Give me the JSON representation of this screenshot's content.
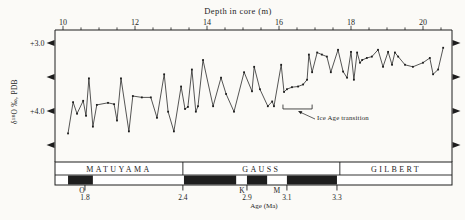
{
  "figure": {
    "background": "#fbfaf7",
    "ink": "#1e1e1e"
  },
  "chart_data": {
    "type": "line",
    "title": "Depth in core (m)",
    "ylabel": "δ¹⁸O ‰, PDB",
    "x_axis": {
      "label_position": "top",
      "ticks": [
        10,
        12,
        14,
        16,
        18,
        20
      ],
      "minor_step": 0.5,
      "minor_from": 10,
      "minor_to": 20.5,
      "range": [
        9.78,
        20.81
      ]
    },
    "y_axis": {
      "ticks": [
        {
          "value": 3.0,
          "label": "+3.0"
        },
        {
          "value": 3.5,
          "label": ""
        },
        {
          "value": 4.0,
          "label": "+4.0"
        },
        {
          "value": 4.5,
          "label": ""
        }
      ],
      "range_top": 2.8,
      "range_bottom": 4.75,
      "marker": "triangle-both-sides"
    },
    "series": [
      {
        "name": "delta-18O-record",
        "marker": "small-square",
        "points": [
          [
            10.14,
            4.33
          ],
          [
            10.28,
            3.87
          ],
          [
            10.39,
            4.04
          ],
          [
            10.56,
            3.85
          ],
          [
            10.64,
            4.07
          ],
          [
            10.72,
            3.52
          ],
          [
            10.83,
            4.23
          ],
          [
            10.94,
            3.91
          ],
          [
            11.25,
            3.88
          ],
          [
            11.42,
            3.9
          ],
          [
            11.5,
            4.14
          ],
          [
            11.61,
            3.52
          ],
          [
            11.83,
            4.3
          ],
          [
            11.94,
            3.78
          ],
          [
            12.19,
            3.8
          ],
          [
            12.44,
            3.8
          ],
          [
            12.61,
            4.1
          ],
          [
            12.81,
            3.46
          ],
          [
            12.92,
            4.01
          ],
          [
            13.08,
            4.3
          ],
          [
            13.28,
            3.64
          ],
          [
            13.39,
            3.97
          ],
          [
            13.47,
            3.94
          ],
          [
            13.58,
            3.39
          ],
          [
            13.69,
            4.01
          ],
          [
            13.75,
            3.93
          ],
          [
            13.89,
            3.25
          ],
          [
            14.17,
            3.93
          ],
          [
            14.39,
            3.51
          ],
          [
            14.53,
            3.75
          ],
          [
            14.75,
            4.01
          ],
          [
            15.03,
            3.43
          ],
          [
            15.25,
            3.71
          ],
          [
            15.31,
            3.35
          ],
          [
            15.47,
            3.68
          ],
          [
            15.69,
            3.93
          ],
          [
            15.81,
            3.86
          ],
          [
            15.86,
            3.93
          ],
          [
            16.06,
            3.32
          ],
          [
            16.14,
            3.72
          ],
          [
            16.22,
            3.68
          ],
          [
            16.36,
            3.65
          ],
          [
            16.53,
            3.64
          ],
          [
            16.67,
            3.61
          ],
          [
            16.78,
            3.54
          ],
          [
            16.83,
            3.17
          ],
          [
            16.92,
            3.43
          ],
          [
            17.06,
            3.14
          ],
          [
            17.19,
            3.17
          ],
          [
            17.33,
            3.2
          ],
          [
            17.44,
            3.43
          ],
          [
            17.64,
            3.1
          ],
          [
            17.78,
            3.42
          ],
          [
            17.89,
            3.51
          ],
          [
            18.0,
            3.13
          ],
          [
            18.08,
            3.54
          ],
          [
            18.17,
            3.14
          ],
          [
            18.25,
            3.29
          ],
          [
            18.31,
            3.25
          ],
          [
            18.44,
            3.22
          ],
          [
            18.58,
            3.2
          ],
          [
            18.75,
            3.1
          ],
          [
            18.89,
            3.35
          ],
          [
            19.03,
            3.13
          ],
          [
            19.14,
            3.32
          ],
          [
            19.22,
            3.14
          ],
          [
            19.31,
            3.2
          ],
          [
            19.5,
            3.32
          ],
          [
            19.72,
            3.35
          ],
          [
            20.0,
            3.29
          ],
          [
            20.19,
            3.22
          ],
          [
            20.28,
            3.46
          ],
          [
            20.42,
            3.39
          ],
          [
            20.56,
            3.07
          ]
        ]
      }
    ],
    "annotation": {
      "text": "Ice Age transition",
      "bracket_depth_from": 16.11,
      "bracket_depth_to": 16.92,
      "bracket_value": 3.97
    }
  },
  "polarity_bar": {
    "axis_label": "Age (Ma)",
    "depth_range": [
      9.78,
      20.81
    ],
    "chrons": [
      {
        "name": "MATUYAMA",
        "from": 9.78,
        "to": 13.33
      },
      {
        "name": "GAUSS",
        "from": 13.33,
        "to": 17.69
      },
      {
        "name": "GILBERT",
        "from": 17.69,
        "to": 20.81
      }
    ],
    "normal_polarity_segments": [
      [
        10.14,
        10.83
      ],
      [
        13.36,
        14.81
      ],
      [
        15.11,
        15.67
      ],
      [
        16.22,
        17.61
      ]
    ],
    "age_ticks": [
      {
        "age": "1.8",
        "depth": 10.61,
        "event": "O",
        "event_depth": 10.53
      },
      {
        "age": "2.4",
        "depth": 13.33,
        "event": "",
        "event_depth": 0
      },
      {
        "age": "2.9",
        "depth": 15.11,
        "event": "K",
        "event_depth": 14.97
      },
      {
        "age": "3.1",
        "depth": 16.22,
        "event": "M",
        "event_depth": 15.94
      },
      {
        "age": "3.3",
        "depth": 17.61,
        "event": "",
        "event_depth": 0
      }
    ]
  }
}
